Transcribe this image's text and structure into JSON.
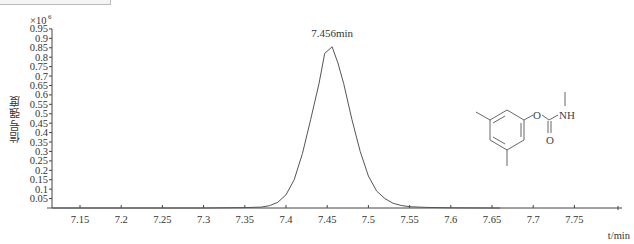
{
  "header_fragment": {
    "clipped_label_visible": true
  },
  "chart_data": {
    "type": "line",
    "title": "",
    "xlabel": "t/min",
    "ylabel": "信号强度",
    "y_multiplier": "×10^6",
    "xlim": [
      7.11,
      7.8
    ],
    "ylim": [
      0,
      0.95
    ],
    "grid": false,
    "legend": null,
    "x_ticks": [
      7.15,
      7.2,
      7.25,
      7.3,
      7.35,
      7.4,
      7.45,
      7.5,
      7.55,
      7.6,
      7.65,
      7.7,
      7.75
    ],
    "x_tick_labels": [
      "7.15",
      "7.2",
      "7.25",
      "7.3",
      "7.35",
      "7.4",
      "7.45",
      "7.5",
      "7.55",
      "7.6",
      "7.65",
      "7.7",
      "7.75"
    ],
    "y_ticks": [
      0.05,
      0.1,
      0.15,
      0.2,
      0.25,
      0.3,
      0.35,
      0.4,
      0.45,
      0.5,
      0.55,
      0.6,
      0.65,
      0.7,
      0.75,
      0.8,
      0.85,
      0.9,
      0.95
    ],
    "y_tick_labels": [
      "0.05",
      "0.1",
      "0.15",
      "0.2",
      "0.25",
      "0.3",
      "0.35",
      "0.4",
      "0.45",
      "0.5",
      "0.55",
      "0.6",
      "0.65",
      "0.7",
      "0.75",
      "0.8",
      "0.85",
      "0.9",
      "0.95"
    ],
    "series": [
      {
        "name": "chromatogram",
        "color": "#555555",
        "x": [
          7.11,
          7.2,
          7.3,
          7.35,
          7.37,
          7.38,
          7.39,
          7.4,
          7.41,
          7.42,
          7.43,
          7.44,
          7.447,
          7.456,
          7.463,
          7.47,
          7.48,
          7.49,
          7.5,
          7.51,
          7.52,
          7.53,
          7.54,
          7.55,
          7.57,
          7.6,
          7.65
        ],
        "y": [
          0.0,
          0.0,
          0.0,
          0.002,
          0.005,
          0.012,
          0.03,
          0.07,
          0.15,
          0.29,
          0.47,
          0.66,
          0.82,
          0.855,
          0.77,
          0.66,
          0.47,
          0.3,
          0.17,
          0.09,
          0.05,
          0.025,
          0.013,
          0.007,
          0.003,
          0.001,
          0.0
        ]
      }
    ],
    "annotations": [
      {
        "text": "7.456min",
        "x": 7.456,
        "y": 0.855,
        "position": "above-peak"
      }
    ],
    "inset": {
      "type": "chemical-structure",
      "description": "3,5-dimethylphenyl N-methylcarbamate",
      "atom_labels": [
        "O",
        "NH",
        "O"
      ]
    }
  }
}
